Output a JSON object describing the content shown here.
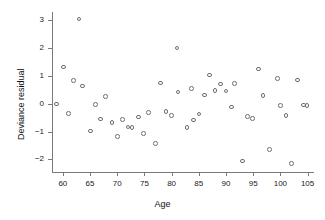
{
  "chart_data": {
    "type": "scatter",
    "title": "",
    "xlabel": "Age",
    "ylabel": "Deviance residual",
    "xlim": [
      58,
      106
    ],
    "ylim": [
      -2.45,
      3.3
    ],
    "xticks": [
      60,
      65,
      70,
      75,
      80,
      85,
      90,
      95,
      100,
      105
    ],
    "yticks": [
      3,
      2,
      1,
      0,
      -1,
      -2
    ],
    "xtick_labels": [
      "60",
      "65",
      "70",
      "75",
      "80",
      "85",
      "90",
      "95",
      "100",
      "105"
    ],
    "ytick_labels": [
      "3",
      "2",
      "1",
      "0",
      "-1",
      "-2"
    ],
    "grid": false,
    "legend": null,
    "marker": "open-circle",
    "marker_color": "#6e6e78",
    "n_points": 57,
    "points": [
      [
        58.8,
        0.0
      ],
      [
        60.1,
        1.32
      ],
      [
        61.0,
        -0.34
      ],
      [
        62.0,
        0.84
      ],
      [
        63.0,
        3.05
      ],
      [
        63.6,
        0.64
      ],
      [
        65.1,
        -0.98
      ],
      [
        66.0,
        -0.02
      ],
      [
        66.9,
        -0.55
      ],
      [
        67.8,
        0.27
      ],
      [
        69.0,
        -0.67
      ],
      [
        70.1,
        -1.17
      ],
      [
        71.0,
        -0.57
      ],
      [
        72.0,
        -0.84
      ],
      [
        72.7,
        -0.86
      ],
      [
        73.9,
        -0.47
      ],
      [
        74.8,
        -1.07
      ],
      [
        75.7,
        -0.31
      ],
      [
        77.0,
        -1.43
      ],
      [
        77.9,
        0.75
      ],
      [
        79.0,
        -0.27
      ],
      [
        80.0,
        -0.43
      ],
      [
        81.0,
        2.01
      ],
      [
        81.2,
        0.43
      ],
      [
        82.8,
        -0.85
      ],
      [
        83.7,
        0.55
      ],
      [
        84.0,
        -0.58
      ],
      [
        85.0,
        -0.37
      ],
      [
        86.0,
        0.31
      ],
      [
        87.0,
        1.04
      ],
      [
        88.0,
        0.47
      ],
      [
        89.0,
        0.71
      ],
      [
        90.0,
        0.46
      ],
      [
        91.0,
        -0.12
      ],
      [
        91.6,
        0.73
      ],
      [
        93.0,
        -2.05
      ],
      [
        94.0,
        -0.45
      ],
      [
        94.9,
        -0.52
      ],
      [
        96.0,
        1.25
      ],
      [
        96.8,
        0.3
      ],
      [
        98.0,
        -1.65
      ],
      [
        99.5,
        0.92
      ],
      [
        100.0,
        -0.06
      ],
      [
        101.0,
        -0.41
      ],
      [
        102.0,
        -2.15
      ],
      [
        103.2,
        0.85
      ],
      [
        104.2,
        -0.04
      ],
      [
        104.9,
        -0.05
      ]
    ]
  }
}
